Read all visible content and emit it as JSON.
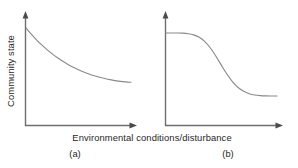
{
  "figure": {
    "background_color": "#ffffff",
    "axis_color": "#6e6e6e",
    "curve_color": "#8a8a8a",
    "text_color": "#1f1f1f",
    "xlabel": "Environmental conditions/disturbance",
    "ylabel": "Community state",
    "panel_a_label": "(a)",
    "panel_b_label": "(b)"
  },
  "chart_data": [
    {
      "type": "line",
      "title": "",
      "panel": "(a)",
      "xlabel": "Environmental conditions/disturbance",
      "ylabel": "Community state",
      "xlim": [
        0,
        1
      ],
      "ylim": [
        0,
        1
      ],
      "grid": false,
      "legend": "none",
      "axis_ticks": "none",
      "description": "Smooth continuous exponential-decay response: community state declines gradually and monotonically as environmental conditions/disturbance increases, approaching a low asymptote.",
      "x": [
        0.0,
        0.05,
        0.1,
        0.15,
        0.2,
        0.25,
        0.3,
        0.35,
        0.4,
        0.45,
        0.5,
        0.55,
        0.6,
        0.65,
        0.7,
        0.75,
        0.8,
        0.85,
        0.9,
        0.95,
        1.0
      ],
      "y": [
        1.0,
        0.92,
        0.845,
        0.777,
        0.715,
        0.659,
        0.608,
        0.562,
        0.521,
        0.484,
        0.451,
        0.421,
        0.395,
        0.372,
        0.352,
        0.335,
        0.32,
        0.308,
        0.298,
        0.291,
        0.286
      ]
    },
    {
      "type": "line",
      "title": "",
      "panel": "(b)",
      "xlabel": "Environmental conditions/disturbance",
      "ylabel": "Community state",
      "xlim": [
        0,
        1
      ],
      "ylim": [
        0,
        1
      ],
      "grid": false,
      "legend": "none",
      "axis_ticks": "none",
      "description": "Threshold/sigmoid response: community state holds at a high plateau, then drops abruptly over a narrow range of environmental conditions/disturbance before stabilising at a low plateau.",
      "x": [
        0.0,
        0.05,
        0.1,
        0.15,
        0.2,
        0.25,
        0.3,
        0.35,
        0.4,
        0.45,
        0.5,
        0.55,
        0.6,
        0.65,
        0.7,
        0.75,
        0.8,
        0.85,
        0.9,
        0.95,
        1.0
      ],
      "y": [
        1.0,
        1.0,
        1.0,
        0.998,
        0.99,
        0.973,
        0.938,
        0.877,
        0.786,
        0.668,
        0.537,
        0.41,
        0.303,
        0.222,
        0.167,
        0.133,
        0.114,
        0.105,
        0.101,
        0.1,
        0.1
      ]
    }
  ]
}
